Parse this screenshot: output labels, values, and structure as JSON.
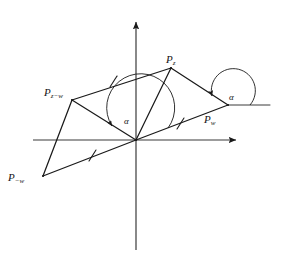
{
  "figure": {
    "type": "geometry-diagram",
    "background_color": "#ffffff",
    "stroke_color": "#1a1a1a"
  },
  "labels": {
    "pz": {
      "base": "P",
      "sub": "z"
    },
    "pzw": {
      "base": "P",
      "sub": "z−w"
    },
    "pw": {
      "base": "P",
      "sub": "w"
    },
    "pmw": {
      "base": "P",
      "sub": "−w"
    },
    "alpha_origin": "α",
    "alpha_pw": "α"
  },
  "geometry": {
    "origin": [
      136,
      140
    ],
    "x_axis": {
      "from": [
        33,
        140
      ],
      "to": [
        240,
        140
      ],
      "arrow": "right"
    },
    "y_axis": {
      "from": [
        136,
        250
      ],
      "to": [
        136,
        18
      ],
      "arrow": "up"
    },
    "points": {
      "P_z": [
        171,
        68
      ],
      "P_z_minus_w": [
        72,
        100
      ],
      "P_w": [
        228,
        105
      ],
      "P_minus_w": [
        43,
        176
      ]
    },
    "segments": [
      {
        "name": "origin-to-Pzw",
        "from": [
          136,
          140
        ],
        "to": [
          72,
          100
        ],
        "ticks": 0
      },
      {
        "name": "Pzw-to-Pz",
        "from": [
          72,
          100
        ],
        "to": [
          171,
          68
        ],
        "ticks": 1
      },
      {
        "name": "Pz-to-Pw",
        "from": [
          171,
          68
        ],
        "to": [
          228,
          105
        ],
        "ticks": 0
      },
      {
        "name": "origin-to-Pz",
        "from": [
          136,
          140
        ],
        "to": [
          171,
          68
        ],
        "ticks": 0
      },
      {
        "name": "origin-to-Pw",
        "from": [
          136,
          140
        ],
        "to": [
          228,
          105
        ],
        "ticks": 1
      },
      {
        "name": "Pmw-to-origin",
        "from": [
          43,
          176
        ],
        "to": [
          136,
          140
        ],
        "ticks": 1
      },
      {
        "name": "Pmw-to-Pzw",
        "from": [
          43,
          176
        ],
        "to": [
          72,
          100
        ],
        "ticks": 0
      },
      {
        "name": "Pw-horizontal-ray",
        "from": [
          228,
          105
        ],
        "to": [
          268,
          105
        ],
        "ticks": 0
      }
    ],
    "tick_marks": [
      {
        "on": "Pzw-to-Pz",
        "at": [
          113,
          81
        ]
      },
      {
        "on": "origin-to-Pw",
        "at": [
          180,
          123
        ]
      },
      {
        "on": "Pmw-to-origin",
        "at": [
          92,
          155
        ]
      }
    ],
    "angle_arcs": [
      {
        "name": "alpha-at-origin",
        "center": [
          136,
          140
        ],
        "from_ray": "origin-to-Pw",
        "to_ray": "origin-to-Pzw",
        "arrow": "counterclockwise"
      },
      {
        "name": "alpha-at-Pw",
        "center": [
          228,
          105
        ],
        "from_ray": "Pw-horizontal-ray",
        "to_ray": "Pw-to-Pz",
        "arrow": "counterclockwise"
      }
    ]
  }
}
